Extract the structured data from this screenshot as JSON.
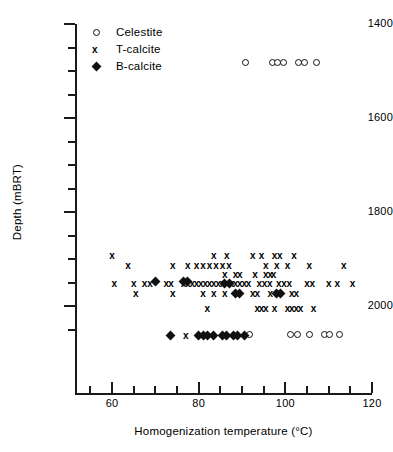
{
  "chart_data": {
    "type": "scatter",
    "title": "",
    "xlabel": "Homogenization temperature (°C)",
    "ylabel": "Depth (mBRT)",
    "xlim": [
      51,
      120
    ],
    "ylim": [
      1400,
      2086
    ],
    "y_inverted": true,
    "grid": false,
    "x_ticks_major": [
      60,
      80,
      100,
      120
    ],
    "x_ticks_minor": [
      55,
      65,
      70,
      75,
      85,
      90,
      95,
      105,
      110,
      115
    ],
    "y_ticks_major": [
      1400,
      1600,
      1800,
      2000
    ],
    "y_ticks_minor": [
      1450,
      1500,
      1550,
      1650,
      1700,
      1750,
      1850,
      1900,
      1950,
      2050
    ],
    "legend_position": "top-left",
    "series": [
      {
        "name": "Celestite",
        "marker": "open-circle",
        "points": [
          [
            91.0,
            1483
          ],
          [
            97.2,
            1483
          ],
          [
            98.5,
            1483
          ],
          [
            99.8,
            1483
          ],
          [
            103.2,
            1483
          ],
          [
            104.6,
            1483
          ],
          [
            107.4,
            1483
          ],
          [
            92.0,
            2063
          ],
          [
            101.5,
            2063
          ],
          [
            103.0,
            2063
          ],
          [
            105.8,
            2063
          ],
          [
            109.2,
            2063
          ],
          [
            110.5,
            2063
          ],
          [
            112.8,
            2063
          ]
        ]
      },
      {
        "name": "T-calcite",
        "marker": "x",
        "points": [
          [
            60.0,
            1893
          ],
          [
            63.7,
            1913
          ],
          [
            83.5,
            1893
          ],
          [
            86.5,
            1893
          ],
          [
            92.5,
            1893
          ],
          [
            94.5,
            1893
          ],
          [
            97.5,
            1893
          ],
          [
            98.7,
            1893
          ],
          [
            102.0,
            1893
          ],
          [
            74.0,
            1913
          ],
          [
            77.5,
            1913
          ],
          [
            79.5,
            1913
          ],
          [
            81.0,
            1913
          ],
          [
            82.5,
            1913
          ],
          [
            84.0,
            1913
          ],
          [
            85.5,
            1913
          ],
          [
            87.0,
            1913
          ],
          [
            95.5,
            1913
          ],
          [
            98.0,
            1913
          ],
          [
            100.5,
            1913
          ],
          [
            105.5,
            1913
          ],
          [
            113.5,
            1913
          ],
          [
            86.0,
            1933
          ],
          [
            88.5,
            1933
          ],
          [
            89.5,
            1933
          ],
          [
            93.0,
            1933
          ],
          [
            95.5,
            1933
          ],
          [
            96.5,
            1933
          ],
          [
            97.3,
            1933
          ],
          [
            60.5,
            1953
          ],
          [
            65.0,
            1953
          ],
          [
            67.5,
            1953
          ],
          [
            68.8,
            1953
          ],
          [
            72.5,
            1953
          ],
          [
            73.6,
            1953
          ],
          [
            76.5,
            1953
          ],
          [
            77.5,
            1953
          ],
          [
            78.5,
            1953
          ],
          [
            79.5,
            1953
          ],
          [
            80.5,
            1953
          ],
          [
            81.5,
            1953
          ],
          [
            82.5,
            1953
          ],
          [
            83.5,
            1953
          ],
          [
            84.5,
            1953
          ],
          [
            85.5,
            1953
          ],
          [
            86.5,
            1953
          ],
          [
            87.5,
            1953
          ],
          [
            88.5,
            1953
          ],
          [
            89.5,
            1953
          ],
          [
            90.5,
            1953
          ],
          [
            91.5,
            1953
          ],
          [
            94.0,
            1953
          ],
          [
            95.2,
            1953
          ],
          [
            96.4,
            1953
          ],
          [
            98.5,
            1953
          ],
          [
            99.7,
            1953
          ],
          [
            100.9,
            1953
          ],
          [
            105.0,
            1953
          ],
          [
            106.2,
            1953
          ],
          [
            110.0,
            1953
          ],
          [
            112.0,
            1953
          ],
          [
            115.5,
            1953
          ],
          [
            65.5,
            1973
          ],
          [
            74.0,
            1973
          ],
          [
            81.0,
            1973
          ],
          [
            83.5,
            1973
          ],
          [
            86.0,
            1973
          ],
          [
            92.5,
            1973
          ],
          [
            93.5,
            1973
          ],
          [
            96.5,
            1973
          ],
          [
            101.5,
            1973
          ],
          [
            102.5,
            1973
          ],
          [
            82.0,
            2005
          ],
          [
            93.5,
            2005
          ],
          [
            94.5,
            2005
          ],
          [
            95.5,
            2005
          ],
          [
            97.5,
            2005
          ],
          [
            100.5,
            2005
          ],
          [
            101.5,
            2005
          ],
          [
            102.5,
            2005
          ],
          [
            103.5,
            2005
          ],
          [
            106.5,
            2005
          ],
          [
            77.0,
            2063
          ]
        ]
      },
      {
        "name": "B-calcite",
        "marker": "filled-diamond",
        "points": [
          [
            70.0,
            1948
          ],
          [
            76.5,
            1948
          ],
          [
            77.5,
            1948
          ],
          [
            86.0,
            1953
          ],
          [
            87.0,
            1953
          ],
          [
            88.5,
            1973
          ],
          [
            89.5,
            1973
          ],
          [
            98.0,
            1973
          ],
          [
            98.9,
            1973
          ],
          [
            73.5,
            2063
          ],
          [
            80.0,
            2063
          ],
          [
            81.0,
            2063
          ],
          [
            82.0,
            2063
          ],
          [
            83.5,
            2063
          ],
          [
            85.5,
            2063
          ],
          [
            86.5,
            2063
          ],
          [
            88.0,
            2063
          ],
          [
            89.0,
            2063
          ],
          [
            90.5,
            2063
          ]
        ]
      }
    ]
  },
  "axis": {
    "y_title": "Depth (mBRT)",
    "x_title": "Homogenization temperature (°C)",
    "y_tick_labels": [
      "1400",
      "1600",
      "1800",
      "2000"
    ],
    "x_tick_labels": [
      "60",
      "80",
      "100",
      "120"
    ]
  },
  "legend": {
    "entries": [
      {
        "label": "Celestite",
        "marker": "open-circle"
      },
      {
        "label": "T-calcite",
        "marker": "x"
      },
      {
        "label": "B-calcite",
        "marker": "filled-diamond"
      }
    ]
  },
  "colors": {
    "ink": "#111111",
    "axis": "#1a1a1a",
    "background": "#ffffff"
  }
}
